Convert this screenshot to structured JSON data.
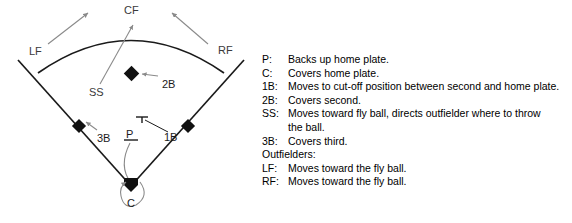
{
  "figure": {
    "colors": {
      "field_line": "#1a1a1a",
      "arrow_gray": "#8a8a8a",
      "base_fill": "#111111",
      "text": "#000000",
      "label_gray": "#3a3a3a",
      "background": "#ffffff"
    }
  },
  "diagram": {
    "labels": {
      "left_field": "LF",
      "center_field": "CF",
      "right_field": "RF",
      "shortstop": "SS",
      "second_base": "2B",
      "third_base": "3B",
      "first_base": "1B",
      "pitcher": "P",
      "catcher": "C"
    },
    "markers": [
      {
        "name": "second-base-marker",
        "shape": "diamond"
      },
      {
        "name": "third-base-marker",
        "shape": "diamond"
      },
      {
        "name": "first-base-marker",
        "shape": "diamond"
      },
      {
        "name": "home-plate-marker",
        "shape": "home-plate"
      },
      {
        "name": "pitcher-mound-marker",
        "shape": "underline"
      },
      {
        "name": "cutoff-position-marker",
        "shape": "tee"
      }
    ],
    "movement_arrows": [
      {
        "name": "lf-movement-arrow",
        "from": "LF",
        "toward": "fly ball"
      },
      {
        "name": "rf-movement-arrow",
        "from": "RF",
        "toward": "fly ball"
      },
      {
        "name": "ss-movement-arrow",
        "from": "SS",
        "toward": "fly ball"
      },
      {
        "name": "2b-pointer-arrow",
        "from": "2B",
        "toward": "second base"
      },
      {
        "name": "3b-pointer-arrow",
        "from": "3B",
        "toward": "third base"
      },
      {
        "name": "1b-pointer-arrow",
        "from": "1B",
        "toward": "cut-off position"
      },
      {
        "name": "pitcher-backup-arrow",
        "from": "P",
        "toward": "home plate"
      },
      {
        "name": "catcher-cover-arrow",
        "from": "C",
        "toward": "home plate"
      }
    ]
  },
  "legend": {
    "entries": [
      {
        "key": "P:",
        "desc": "Backs up home plate."
      },
      {
        "key": "C:",
        "desc": "Covers home plate."
      },
      {
        "key": "1B:",
        "desc": "Moves to cut-off position between second and home plate."
      },
      {
        "key": "2B:",
        "desc": "Covers second."
      },
      {
        "key": "SS:",
        "desc": "Moves toward fly ball, directs outfielder where to throw",
        "cont": "the ball."
      },
      {
        "key": "3B:",
        "desc": "Covers third."
      }
    ],
    "outfielders_heading": "Outfielders:",
    "outfielder_entries": [
      {
        "key": "LF:",
        "desc": "Moves toward the fly ball."
      },
      {
        "key": "RF:",
        "desc": "Moves toward the fly ball."
      }
    ]
  }
}
